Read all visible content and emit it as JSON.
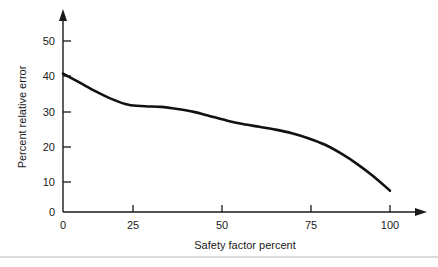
{
  "figure": {
    "background_color": "#ffffff",
    "line_color": "#111111",
    "axis_color": "#1a1a1a",
    "rule_color": "#b9b9b9"
  },
  "chart_data": {
    "type": "line",
    "title": "",
    "xlabel": "Safety factor percent",
    "ylabel": "Percent relative error",
    "xlim": [
      0,
      100
    ],
    "ylim": [
      0,
      55
    ],
    "xticks": [
      0,
      25,
      50,
      75,
      100
    ],
    "xtick_labels": [
      "0",
      "25",
      "50",
      "75",
      "100"
    ],
    "yticks": [
      0,
      10,
      20,
      30,
      40,
      50
    ],
    "ytick_labels": [
      "0",
      "10",
      "20",
      "30",
      "40",
      "50"
    ],
    "grid": false,
    "legend": null,
    "series": [
      {
        "name": "Percent relative error vs safety factor percent",
        "x": [
          0,
          5,
          10,
          15,
          20,
          25,
          30,
          35,
          40,
          45,
          50,
          55,
          60,
          65,
          70,
          75,
          80,
          85,
          90,
          95,
          100
        ],
        "values": [
          39,
          36.5,
          34,
          31.8,
          30.2,
          29.8,
          29.6,
          29.0,
          28.2,
          27.0,
          25.8,
          24.8,
          24.0,
          23.2,
          22.2,
          20.8,
          19.0,
          16.5,
          13.5,
          10.0,
          6.0
        ]
      }
    ]
  },
  "axes": {
    "x_arrow": "arrow-right",
    "y_arrow": "arrow-up"
  }
}
